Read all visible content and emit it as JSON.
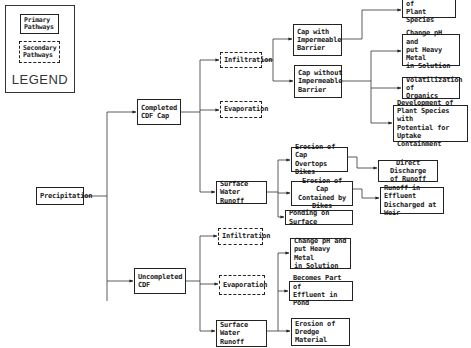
{
  "legend": {
    "title": "LEGEND",
    "primary": "Primary\nPathways",
    "secondary": "Secondary\nPathways"
  },
  "nodes": {
    "precipitation": "Precipitation",
    "completed_cdf_cap": "Completed\nCDF Cap",
    "uncompleted_cdf": "Uncompleted\nCDF",
    "cap_infiltration": "Infiltration",
    "cap_evaporation": "Evaporation",
    "cap_surface_runoff": "Surface Water\nRunoff",
    "cap_with_barrier": "Cap with\nImpermeable\nBarrier",
    "cap_without_barrier": "Cap without\nImpermeable\nBarrier",
    "plant_species": "Development of\nPlant Species",
    "change_ph_top": "Change pH and\nput Heavy Metal\nin Solution",
    "volatilization": "Volatilization of\nOrganics",
    "plant_uptake": "Development of\nPlant Species with\nPotential for\nUptake Containment",
    "erosion_overtops": "Erosion of Cap\nOvertops Dikes",
    "erosion_contained": "Erosion of Cap\nContained by Dikes",
    "ponding": "Ponding on Surface",
    "direct_discharge": "Direct Discharge\nof Runoff",
    "runoff_effluent": "Runoff in Effluent\nDischarged at Weir",
    "uncap_infiltration": "Infiltration",
    "uncap_evaporation": "Evaporation",
    "uncap_surface_runoff": "Surface Water\nRunoff",
    "change_ph_bottom": "Change pH and\nput Heavy Metal\nin Solution",
    "becomes_part": "Becomes Part of\nEffluent in Pond",
    "erosion_dredge": "Erosion of\nDredge Material"
  }
}
